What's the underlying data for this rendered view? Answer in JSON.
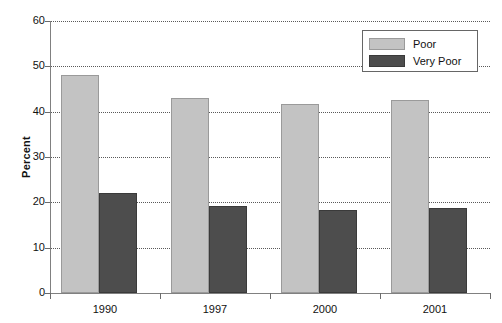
{
  "chart_data": {
    "type": "bar",
    "title": "",
    "subtitle": "",
    "xlabel": "",
    "ylabel": "Percent",
    "categories": [
      "1990",
      "1997",
      "2000",
      "2001"
    ],
    "series": [
      {
        "name": "Poor",
        "color": "#c3c3c3",
        "values": [
          48.0,
          43.0,
          41.7,
          42.5
        ]
      },
      {
        "name": "Very Poor",
        "color": "#4d4d4d",
        "values": [
          22.0,
          19.2,
          18.3,
          18.8
        ]
      }
    ],
    "ylim": [
      0,
      60
    ],
    "ytick_step": 10,
    "yticks": [
      "60",
      "50",
      "40",
      "30",
      "20",
      "10",
      "0"
    ],
    "ytick_values": [
      60,
      50,
      40,
      30,
      20,
      10,
      0
    ],
    "grid": "horizontal-dotted",
    "legend_position": "top-right",
    "background_color": "#ffffff",
    "axis_color": "#808080",
    "grid_color": "#5a5a5a",
    "text_color": "#111111"
  },
  "legend": {
    "items": [
      {
        "label": "Poor"
      },
      {
        "label": "Very Poor"
      }
    ]
  },
  "axes": {
    "y_title": "Percent"
  }
}
